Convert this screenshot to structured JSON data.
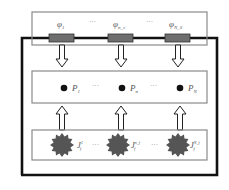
{
  "diagram": {
    "type": "block-diagram",
    "colors": {
      "outer_frame": "#111111",
      "panel_border": "#8a8a8a",
      "resistor_fill": "#6e6e6e",
      "node_dot": "#111111",
      "source_fill": "#555555",
      "arrow_stroke": "#222222"
    },
    "top_panel": {
      "labels": [
        {
          "base": "φ",
          "sub": "1"
        },
        {
          "sep": "···"
        },
        {
          "base": "φ",
          "sub": "n_s"
        },
        {
          "sep": "···"
        },
        {
          "base": "φ",
          "sub": "N_S"
        }
      ],
      "label_text": {
        "phi1": "φ",
        "phi1_sub": "1",
        "sep1": "···",
        "phin": "φ",
        "phin_sub": "n_s",
        "sep2": "···",
        "phiN": "φ",
        "phiN_sub": "N_S"
      },
      "elements": [
        "resistor",
        "resistor",
        "resistor"
      ]
    },
    "middle_panel": {
      "label_text": {
        "p1": "P",
        "p1_sub": "1",
        "sep1": "···",
        "pn": "P",
        "pn_sub": "n",
        "sep2": "···",
        "pN": "P",
        "pN_sub": "N"
      },
      "nodes": [
        "P_1",
        "P_n",
        "P_N"
      ]
    },
    "bottom_panel": {
      "label_text": {
        "j1": "J",
        "j1_sup": "1",
        "j1_sub": "f",
        "sep1": "···",
        "jn": "J",
        "jn_sup": "n_f",
        "jn_sub": "f",
        "sep2": "···",
        "jN": "J",
        "jN_sup": "N_f",
        "jN_sub": "f"
      },
      "sources": [
        "J_f^1",
        "J_f^{n_f}",
        "J_f^{N_f}"
      ]
    },
    "arrows": {
      "top_to_middle": "down",
      "bottom_to_middle": "up",
      "count_each": 3
    }
  }
}
